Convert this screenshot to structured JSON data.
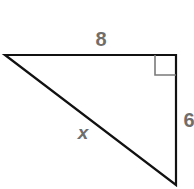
{
  "diagram": {
    "type": "right-triangle",
    "labels": {
      "top_side": "8",
      "right_side": "6",
      "hypotenuse": "x"
    },
    "colors": {
      "line": "#111111",
      "label": "#6e6e6e",
      "right_angle_marker": "#7a7a7a"
    }
  }
}
